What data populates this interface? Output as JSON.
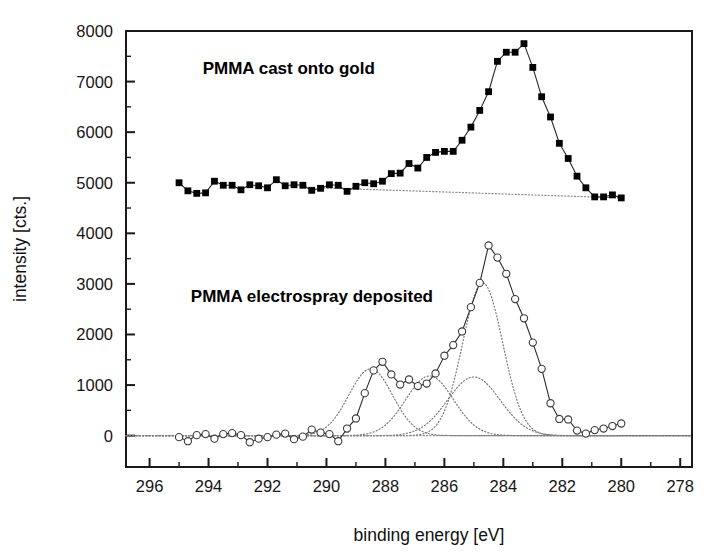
{
  "chart_data": {
    "type": "line",
    "title": "",
    "xlabel": "binding energy [eV]",
    "ylabel": "intensity [cts.]",
    "xlim": [
      296.8,
      277.6
    ],
    "ylim": [
      -620,
      8000
    ],
    "x_reversed": true,
    "grid": false,
    "legend_position": "inline-annotations",
    "x_major_ticks": [
      296,
      294,
      292,
      290,
      288,
      286,
      284,
      282,
      280,
      278
    ],
    "x_minor_step": 1,
    "y_major_ticks": [
      0,
      1000,
      2000,
      3000,
      4000,
      5000,
      6000,
      7000,
      8000
    ],
    "y_minor_step": 500,
    "x_tick_labels": [
      "296",
      "294",
      "292",
      "290",
      "288",
      "286",
      "284",
      "282",
      "280",
      "278"
    ],
    "y_tick_labels": [
      "0",
      "1000",
      "2000",
      "3000",
      "4000",
      "5000",
      "6000",
      "7000",
      "8000"
    ],
    "annotations": [
      {
        "text": "PMMA cast onto gold",
        "x": 294.2,
        "y": 7150
      },
      {
        "text": "PMMA electrospray deposited",
        "x": 294.6,
        "y": 2650
      }
    ],
    "series": [
      {
        "name": "PMMA cast onto gold",
        "marker": "filled-square",
        "x": [
          295.0,
          294.7,
          294.4,
          294.1,
          293.8,
          293.5,
          293.2,
          292.9,
          292.6,
          292.3,
          292.0,
          291.7,
          291.4,
          291.1,
          290.8,
          290.5,
          290.2,
          289.9,
          289.6,
          289.3,
          289.0,
          288.7,
          288.4,
          288.1,
          287.8,
          287.5,
          287.2,
          286.9,
          286.6,
          286.3,
          286.0,
          285.7,
          285.4,
          285.1,
          284.8,
          284.5,
          284.2,
          283.9,
          283.6,
          283.3,
          283.0,
          282.7,
          282.4,
          282.1,
          281.8,
          281.5,
          281.2,
          280.9,
          280.6,
          280.3,
          280.0
        ],
        "y": [
          5000,
          4840,
          4790,
          4800,
          5030,
          4950,
          4950,
          4860,
          4960,
          4940,
          4900,
          5060,
          4940,
          4960,
          4950,
          4850,
          4890,
          4960,
          4950,
          4830,
          4930,
          5000,
          4980,
          5030,
          5180,
          5190,
          5380,
          5290,
          5500,
          5600,
          5620,
          5620,
          5840,
          6100,
          6430,
          6800,
          7400,
          7580,
          7580,
          7750,
          7280,
          6700,
          6300,
          5780,
          5480,
          5130,
          4900,
          4720,
          4720,
          4760,
          4700
        ],
        "baseline_dotted": {
          "x": [
            290.2,
            280.0
          ],
          "y": [
            4900,
            4700
          ]
        }
      },
      {
        "name": "PMMA electrospray deposited",
        "marker": "open-circle",
        "x": [
          295.0,
          294.7,
          294.4,
          294.1,
          293.8,
          293.5,
          293.2,
          292.9,
          292.6,
          292.3,
          292.0,
          291.7,
          291.4,
          291.1,
          290.8,
          290.5,
          290.2,
          289.9,
          289.6,
          289.3,
          289.0,
          288.7,
          288.4,
          288.1,
          287.8,
          287.5,
          287.2,
          286.9,
          286.6,
          286.3,
          286.0,
          285.7,
          285.4,
          285.1,
          284.8,
          284.5,
          284.2,
          283.9,
          283.6,
          283.3,
          283.0,
          282.7,
          282.4,
          282.1,
          281.8,
          281.5,
          281.2,
          280.9,
          280.6,
          280.3,
          280.0
        ],
        "y": [
          -30,
          -110,
          10,
          30,
          -60,
          30,
          50,
          10,
          -130,
          -60,
          -30,
          20,
          40,
          -70,
          -20,
          120,
          60,
          30,
          -110,
          140,
          340,
          840,
          1290,
          1460,
          1210,
          1010,
          1110,
          980,
          1030,
          1230,
          1580,
          1790,
          2060,
          2540,
          3020,
          3760,
          3520,
          3200,
          2700,
          2320,
          1840,
          1320,
          640,
          330,
          320,
          100,
          40,
          110,
          140,
          190,
          240
        ],
        "fit_components": [
          {
            "name": "component-289-eV",
            "center": 288.5,
            "amplitude": 1320,
            "fwhm": 1.75
          },
          {
            "name": "component-287-eV",
            "center": 286.5,
            "amplitude": 1180,
            "fwhm": 1.9
          },
          {
            "name": "component-285-eV",
            "center": 285.0,
            "amplitude": 1160,
            "fwhm": 2.1
          },
          {
            "name": "component-284-eV",
            "center": 284.7,
            "amplitude": 3020,
            "fwhm": 1.6
          }
        ],
        "baseline_dotted": {
          "x": [
            295.0,
            280.0
          ],
          "y": [
            0,
            0
          ]
        }
      }
    ]
  },
  "axes": {
    "x_title": "binding energy [eV]",
    "y_title": "intensity [cts.]"
  }
}
